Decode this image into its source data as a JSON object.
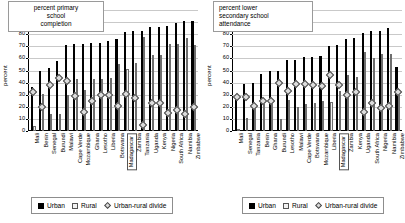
{
  "chart_data": [
    {
      "type": "bar",
      "title": "percent primary school completion",
      "xlabel": "",
      "ylabel": "percent",
      "ylim": [
        0,
        100
      ],
      "yticks": [
        0,
        10,
        20,
        30,
        40,
        50,
        60,
        70,
        80,
        90,
        100
      ],
      "grid": true,
      "legend_position": "below",
      "highlight_category": "Madagascar",
      "categories": [
        "Mali",
        "Benin",
        "Senegal",
        "Burundi",
        "Malawi",
        "Cape Verde",
        "Mozambique",
        "Ghana",
        "Lesotho",
        "Liberia",
        "Botswana",
        "Madagascar",
        "Zambia",
        "Tanzania",
        "Uganda",
        "Kenya",
        "Nigeria",
        "South Africa",
        "Namibia",
        "Zimbabwe"
      ],
      "series": [
        {
          "name": "Urban",
          "values": [
            36,
            50,
            52,
            58,
            71,
            72,
            72,
            73,
            73,
            74,
            76,
            82,
            83,
            83,
            86,
            86,
            87,
            89,
            91,
            91
          ]
        },
        {
          "name": "Rural",
          "values": [
            4,
            31,
            14,
            14,
            30,
            43,
            34,
            43,
            43,
            44,
            55,
            51,
            56,
            78,
            63,
            63,
            72,
            72,
            77,
            71
          ]
        },
        {
          "name": "Urban-rural divide",
          "values": [
            32,
            20,
            38,
            44,
            41,
            29,
            16,
            25,
            30,
            30,
            21,
            31,
            27,
            5,
            23,
            23,
            15,
            17,
            14,
            20
          ]
        }
      ]
    },
    {
      "type": "bar",
      "title": "percent lower secondary school attendance",
      "xlabel": "",
      "ylabel": "percent",
      "ylim": [
        0,
        100
      ],
      "yticks": [
        0,
        10,
        20,
        30,
        40,
        50,
        60,
        70,
        80,
        90,
        100
      ],
      "grid": true,
      "legend_position": "below",
      "highlight_category": "Madagascar",
      "categories": [
        "Mali",
        "Senegal",
        "Tanzania",
        "Benin",
        "Ghana",
        "Burundi",
        "Lesotho",
        "Malawi",
        "Cape Verde",
        "Botswana",
        "Mozambique",
        "Liberia",
        "Madagascar",
        "Zambia",
        "Kenya",
        "Uganda",
        "South Africa",
        "Nigeria",
        "Namibia",
        "Zimbabwe"
      ],
      "series": [
        {
          "name": "Urban",
          "values": [
            29,
            39,
            40,
            47,
            50,
            50,
            59,
            59,
            61,
            61,
            62,
            70,
            71,
            76,
            77,
            81,
            83,
            83,
            85,
            53
          ]
        },
        {
          "name": "Rural",
          "values": [
            1,
            11,
            19,
            22,
            25,
            10,
            26,
            20,
            22,
            23,
            25,
            24,
            33,
            46,
            45,
            65,
            60,
            64,
            64,
            30
          ]
        },
        {
          "name": "Urban-rural divide",
          "values": [
            28,
            28,
            21,
            25,
            25,
            40,
            33,
            39,
            39,
            38,
            37,
            46,
            38,
            30,
            32,
            16,
            23,
            19,
            21,
            32
          ]
        }
      ]
    }
  ],
  "legend": {
    "urban": "Urban",
    "rural": "Rural",
    "divide": "Urban-rural divide"
  },
  "panels": [
    {
      "id": "primary-completion",
      "title_lines": [
        "percent primary",
        "school",
        "completion"
      ],
      "axis_title": "percent"
    },
    {
      "id": "lower-secondary-attendance",
      "title_lines": [
        "percent lower",
        "secondary school",
        "attendance"
      ],
      "axis_title": "percent"
    }
  ]
}
